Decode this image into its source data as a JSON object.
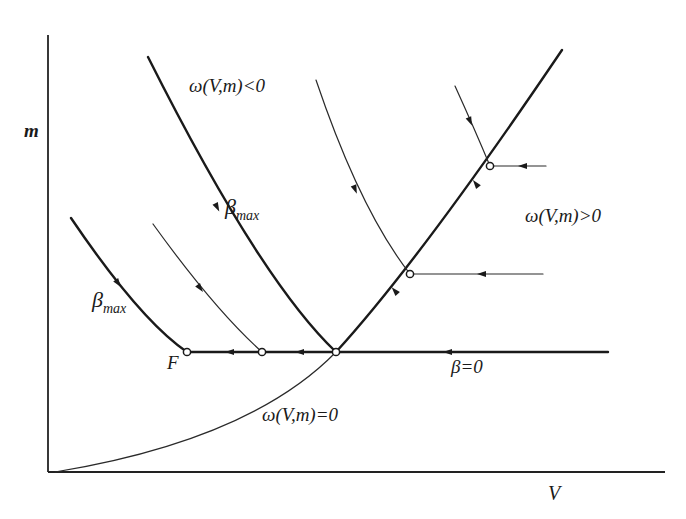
{
  "diagram": {
    "type": "phase-plane",
    "axes": {
      "x_label": "V",
      "y_label": "m",
      "origin": [
        48,
        472
      ],
      "x_end": [
        665,
        472
      ],
      "y_end": [
        48,
        35
      ]
    },
    "labels": {
      "region_negative": "ω(V,m)<0",
      "region_positive": "ω(V,m)>0",
      "singular_curve": "ω(V,m)=0",
      "beta_zero": "β=0",
      "beta_max_upper": "β",
      "beta_max_upper_sub": "max",
      "beta_max_lower": "β",
      "beta_max_lower_sub": "max",
      "final_point": "F"
    },
    "curves": [
      {
        "name": "singular-arc-lower",
        "style": "thin",
        "d": "M 55 472 Q 250 440 336 352"
      },
      {
        "name": "singular-arc-upper",
        "style": "thick",
        "d": "M 336 352 Q 420 260 562 50"
      },
      {
        "name": "beta-max-upper",
        "style": "thick",
        "d": "M 148 57 Q 260 280 336 352"
      },
      {
        "name": "beta-max-lower",
        "style": "thick",
        "d": "M 71 218 Q 140 320 187 352"
      },
      {
        "name": "trajectory-mid-left",
        "style": "thin",
        "d": "M 153 224 Q 215 310 262 352"
      },
      {
        "name": "trajectory-upper-center",
        "style": "thin",
        "d": "M 316 80 Q 360 210 410 274"
      },
      {
        "name": "trajectory-top-right",
        "style": "thin",
        "d": "M 455 86 Q 475 130 490 166"
      },
      {
        "name": "beta-zero-line",
        "style": "thick",
        "d": "M 187 352 L 608 352"
      },
      {
        "name": "feeder-line-mid",
        "style": "thin",
        "d": "M 410 274 L 543 274"
      },
      {
        "name": "feeder-line-top",
        "style": "thin",
        "d": "M 490 166 L 546 166"
      }
    ],
    "nodes": [
      {
        "name": "final-point-F",
        "x": 187,
        "y": 352
      },
      {
        "name": "junction-mid-left",
        "x": 262,
        "y": 352
      },
      {
        "name": "junction-central",
        "x": 336,
        "y": 352
      },
      {
        "name": "junction-mid",
        "x": 410,
        "y": 274
      },
      {
        "name": "junction-top",
        "x": 490,
        "y": 166
      }
    ],
    "arrows": [
      {
        "name": "arrow-beta0-right",
        "x": 448,
        "y": 352,
        "angle": 180
      },
      {
        "name": "arrow-beta0-center",
        "x": 300,
        "y": 352,
        "angle": 180
      },
      {
        "name": "arrow-beta0-left",
        "x": 230,
        "y": 352,
        "angle": 180
      },
      {
        "name": "arrow-feeder-mid",
        "x": 482,
        "y": 274,
        "angle": 180
      },
      {
        "name": "arrow-feeder-top",
        "x": 523,
        "y": 166,
        "angle": 180
      },
      {
        "name": "arrow-singular-lower",
        "x": 395,
        "y": 291,
        "angle": 228
      },
      {
        "name": "arrow-singular-upper",
        "x": 476,
        "y": 184,
        "angle": 232
      },
      {
        "name": "arrow-betamax-upper",
        "x": 217,
        "y": 207,
        "angle": 63
      },
      {
        "name": "arrow-betamax-lower",
        "x": 118,
        "y": 283,
        "angle": 55
      },
      {
        "name": "arrow-traj-midleft",
        "x": 200,
        "y": 288,
        "angle": 53
      },
      {
        "name": "arrow-traj-upper",
        "x": 355,
        "y": 189,
        "angle": 68
      },
      {
        "name": "arrow-traj-top",
        "x": 470,
        "y": 121,
        "angle": 67
      }
    ],
    "colors": {
      "ink": "#1a1a1a",
      "background": "#ffffff"
    }
  }
}
